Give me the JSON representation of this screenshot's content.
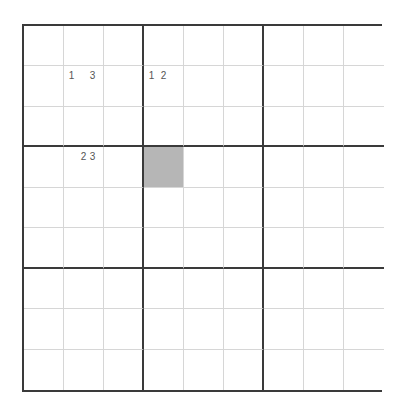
{
  "board": {
    "rows": 9,
    "cols": 9,
    "box_size": 3,
    "colors": {
      "thick_line": "#3a3a3a",
      "thin_line": "#d6d6d6",
      "selected_cell": "#b6b6b6",
      "pencil_text": "#555555"
    },
    "selected_cell": {
      "row": 3,
      "col": 3
    },
    "pencil_marks": [
      {
        "row": 1,
        "col": 1,
        "marks": [
          "1",
          "",
          "3"
        ]
      },
      {
        "row": 1,
        "col": 3,
        "marks": [
          "1",
          "2",
          ""
        ]
      },
      {
        "row": 3,
        "col": 1,
        "marks": [
          "",
          "2",
          "3"
        ]
      }
    ]
  }
}
